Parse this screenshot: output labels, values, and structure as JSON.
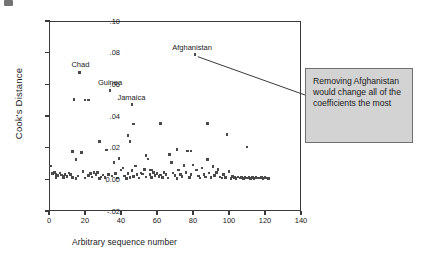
{
  "chart_data": {
    "type": "scatter",
    "title": "",
    "xlabel": "Arbitrary sequence number",
    "ylabel": "Cook's Distance",
    "xlim": [
      0,
      140
    ],
    "ylim": [
      -0.02,
      0.1
    ],
    "xticks": [
      "0",
      "20",
      "40",
      "60",
      "80",
      "100",
      "120",
      "140"
    ],
    "xtick_values": [
      0,
      20,
      40,
      60,
      80,
      100,
      120,
      140
    ],
    "yticks": [
      "-.02",
      "0.00",
      ".02",
      ".04",
      ".06",
      ".08",
      ".10"
    ],
    "ytick_values": [
      -0.02,
      0.0,
      0.02,
      0.04,
      0.06,
      0.08,
      0.1
    ],
    "grid": false,
    "legend": "none",
    "marker": "square",
    "marker_color": "#4a4a4a",
    "annotations": [
      {
        "label": "Chad",
        "x": 17,
        "y": 0.0675
      },
      {
        "label": "Guinea",
        "x": 34,
        "y": 0.0562
      },
      {
        "label": "Jamaica",
        "x": 46,
        "y": 0.0472
      },
      {
        "label": "Afghanistan",
        "x": 81,
        "y": 0.0787
      }
    ],
    "callout": {
      "text": "Removing Afghanistan would change all of the coefficients the most",
      "points_to": "Afghanistan",
      "fill": "#d3d3d3",
      "border": "#6f6f6f"
    },
    "points": [
      [
        1,
        0.0085
      ],
      [
        2,
        0.0035
      ],
      [
        3,
        0.0042
      ],
      [
        4,
        0.003
      ],
      [
        4,
        0.0012
      ],
      [
        5,
        0.0025
      ],
      [
        6,
        0.004
      ],
      [
        7,
        0.0028
      ],
      [
        8,
        0.002
      ],
      [
        8,
        0.0008
      ],
      [
        9,
        0.0032
      ],
      [
        10,
        0.0018
      ],
      [
        11,
        0.004
      ],
      [
        12,
        0.003
      ],
      [
        13,
        0.0175
      ],
      [
        13,
        0.0013
      ],
      [
        14,
        0.0505
      ],
      [
        15,
        0.0125
      ],
      [
        15,
        0.0004
      ],
      [
        16,
        0.002
      ],
      [
        17,
        0.0675
      ],
      [
        18,
        0.017
      ],
      [
        19,
        0.005
      ],
      [
        20,
        0.0502
      ],
      [
        20,
        0.0008
      ],
      [
        22,
        0.0502
      ],
      [
        22,
        0.0026
      ],
      [
        23,
        0.0035
      ],
      [
        24,
        0.0015
      ],
      [
        25,
        0.0045
      ],
      [
        26,
        0.003
      ],
      [
        27,
        0.0042
      ],
      [
        28,
        0.024
      ],
      [
        28,
        0.0007
      ],
      [
        29,
        0.0016
      ],
      [
        30,
        0.0028
      ],
      [
        31,
        0.0011
      ],
      [
        32,
        0.0185
      ],
      [
        33,
        0.003
      ],
      [
        34,
        0.0562
      ],
      [
        35,
        0.0021
      ],
      [
        36,
        0.0108
      ],
      [
        37,
        0.0035
      ],
      [
        38,
        0.0009
      ],
      [
        39,
        0.013
      ],
      [
        40,
        0.0058
      ],
      [
        41,
        0.0072
      ],
      [
        42,
        0.002
      ],
      [
        43,
        0.0007
      ],
      [
        44,
        0.0278
      ],
      [
        44,
        0.0038
      ],
      [
        45,
        0.024
      ],
      [
        45,
        0.0012
      ],
      [
        46,
        0.0472
      ],
      [
        46,
        0.0057
      ],
      [
        47,
        0.035
      ],
      [
        47,
        0.0018
      ],
      [
        48,
        0.0085
      ],
      [
        49,
        0.003
      ],
      [
        50,
        0.0008
      ],
      [
        51,
        0.004
      ],
      [
        52,
        0.0033
      ],
      [
        53,
        0.0062
      ],
      [
        54,
        0.015
      ],
      [
        54,
        0.0014
      ],
      [
        55,
        0.0128
      ],
      [
        56,
        0.006
      ],
      [
        56,
        0.003
      ],
      [
        57,
        0.0058
      ],
      [
        57,
        0.001
      ],
      [
        58,
        0.0042
      ],
      [
        59,
        0.0025
      ],
      [
        60,
        0.0036
      ],
      [
        61,
        0.0018
      ],
      [
        62,
        0.0352
      ],
      [
        62,
        0.0028
      ],
      [
        63,
        0.0012
      ],
      [
        64,
        0.0045
      ],
      [
        65,
        0.003
      ],
      [
        66,
        0.0008
      ],
      [
        67,
        0.0155
      ],
      [
        68,
        0.0105
      ],
      [
        69,
        0.004
      ],
      [
        70,
        0.0025
      ],
      [
        71,
        0.019
      ],
      [
        71,
        0.0006
      ],
      [
        72,
        0.006
      ],
      [
        73,
        0.0032
      ],
      [
        74,
        0.0018
      ],
      [
        75,
        0.0088
      ],
      [
        76,
        0.0042
      ],
      [
        77,
        0.018
      ],
      [
        78,
        0.0012
      ],
      [
        79,
        0.0178
      ],
      [
        79,
        0.003
      ],
      [
        80,
        0.009
      ],
      [
        81,
        0.0787
      ],
      [
        82,
        0.006
      ],
      [
        83,
        0.0022
      ],
      [
        84,
        0.0008
      ],
      [
        85,
        0.0072
      ],
      [
        86,
        0.003
      ],
      [
        87,
        0.0015
      ],
      [
        88,
        0.0352
      ],
      [
        88,
        0.0125
      ],
      [
        89,
        0.004
      ],
      [
        90,
        0.001
      ],
      [
        91,
        0.0082
      ],
      [
        92,
        0.0025
      ],
      [
        93,
        0.0045
      ],
      [
        94,
        0.0062
      ],
      [
        95,
        0.0014
      ],
      [
        96,
        0.0008
      ],
      [
        97,
        0.003
      ],
      [
        98,
        0.0012
      ],
      [
        99,
        0.0282
      ],
      [
        100,
        0.005
      ],
      [
        101,
        0.0006
      ],
      [
        102,
        0.0018
      ],
      [
        103,
        0.001
      ],
      [
        104,
        0.0007
      ],
      [
        105,
        0.0014
      ],
      [
        106,
        0.0009
      ],
      [
        107,
        0.0012
      ],
      [
        108,
        0.0006
      ],
      [
        109,
        0.0011
      ],
      [
        110,
        0.0205
      ],
      [
        110,
        0.0008
      ],
      [
        111,
        0.0013
      ],
      [
        112,
        0.0007
      ],
      [
        113,
        0.001
      ],
      [
        114,
        0.0006
      ],
      [
        115,
        0.0012
      ],
      [
        116,
        0.0008
      ],
      [
        117,
        0.0009
      ],
      [
        118,
        0.0011
      ],
      [
        119,
        0.0007
      ],
      [
        120,
        0.0013
      ],
      [
        121,
        0.0009
      ],
      [
        122,
        0.0006
      ]
    ]
  }
}
